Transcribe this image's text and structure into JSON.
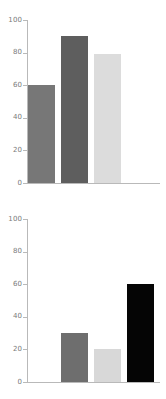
{
  "chart_data": [
    {
      "type": "bar",
      "title": "",
      "xlabel": "",
      "ylabel": "",
      "categories": [
        "1",
        "2",
        "3",
        "4"
      ],
      "values": [
        60,
        90,
        79,
        0
      ],
      "colors": [
        "#777777",
        "#5e5e5e",
        "#dcdcdc",
        "#ffffff"
      ],
      "ylim": [
        0,
        100
      ],
      "yticks": [
        0,
        20,
        40,
        60,
        80,
        100
      ],
      "ytick_labels": [
        "0",
        "20",
        "40",
        "60",
        "80",
        "100"
      ],
      "grid": false,
      "legend": false
    },
    {
      "type": "bar",
      "title": "",
      "xlabel": "",
      "ylabel": "",
      "categories": [
        "1",
        "2",
        "3",
        "4"
      ],
      "values": [
        0,
        30,
        20,
        60
      ],
      "colors": [
        "#ffffff",
        "#6e6e6e",
        "#d8d8d8",
        "#050505"
      ],
      "ylim": [
        0,
        100
      ],
      "yticks": [
        0,
        20,
        40,
        60,
        80,
        100
      ],
      "ytick_labels": [
        "0",
        "20",
        "40",
        "60",
        "80",
        "100"
      ],
      "grid": false,
      "legend": false
    }
  ],
  "style": {
    "axis_color": "#b9b9b9",
    "tick_text_color": "#7a7a7a",
    "background": "#ffffff"
  }
}
